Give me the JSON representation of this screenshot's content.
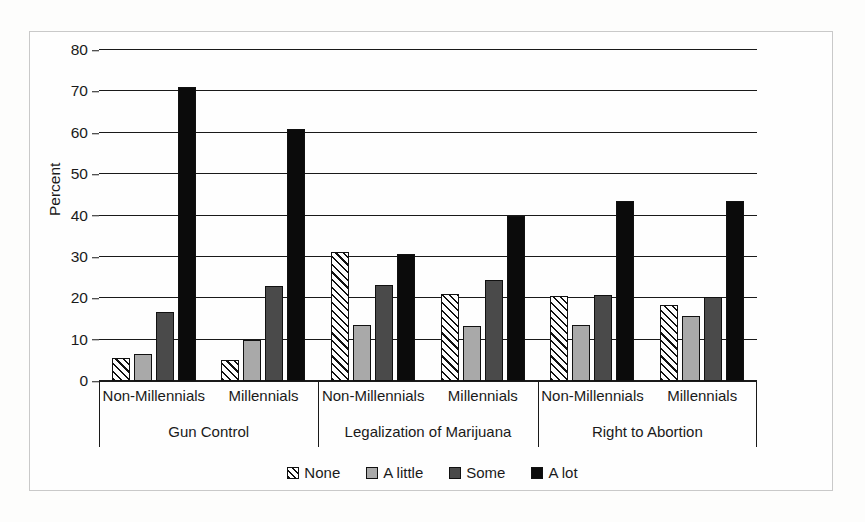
{
  "chart_data": {
    "type": "bar",
    "title": "",
    "subtitle": "",
    "xlabel": "",
    "ylabel": "Percent",
    "ylim": [
      0,
      80
    ],
    "yticks": [
      0,
      10,
      20,
      30,
      40,
      50,
      60,
      70,
      80
    ],
    "ytick_labels": [
      "0",
      "10",
      "20",
      "30",
      "40",
      "50",
      "60",
      "70",
      "80"
    ],
    "grid": true,
    "legend_position": "bottom",
    "legend_entries": [
      "None",
      "A little",
      "Some",
      "A lot"
    ],
    "group_labels": [
      "Gun Control",
      "Legalization of Marijuana",
      "Right to Abortion"
    ],
    "subgroup_labels": [
      "Non-Millennials",
      "Millennials"
    ],
    "categories": [
      "Gun Control / Non-Millennials",
      "Gun Control / Millennials",
      "Legalization of Marijuana / Non-Millennials",
      "Legalization of Marijuana / Millennials",
      "Right to Abortion / Non-Millennials",
      "Right to Abortion / Millennials"
    ],
    "series": [
      {
        "name": "None",
        "pattern": "diagonal-hatch",
        "color": "#ffffff",
        "values": [
          5.5,
          5.0,
          31.2,
          21.0,
          20.6,
          18.4
        ]
      },
      {
        "name": "A little",
        "pattern": "solid",
        "color": "#a9a9a9",
        "values": [
          6.6,
          10.0,
          13.5,
          13.2,
          13.6,
          15.8
        ]
      },
      {
        "name": "Some",
        "pattern": "solid",
        "color": "#4a4a4a",
        "values": [
          16.8,
          23.0,
          23.3,
          24.4,
          20.9,
          20.4
        ]
      },
      {
        "name": "A lot",
        "pattern": "solid",
        "color": "#0b0b0b",
        "values": [
          71.1,
          61.0,
          30.8,
          39.8,
          43.4,
          43.5
        ]
      }
    ],
    "groups": [
      {
        "label": "Gun Control",
        "subgroups": [
          {
            "label": "Non-Millennials",
            "bars": [
              {
                "series": "None",
                "value": 5.5
              },
              {
                "series": "A little",
                "value": 6.6
              },
              {
                "series": "Some",
                "value": 16.8
              },
              {
                "series": "A lot",
                "value": 71.1
              }
            ]
          },
          {
            "label": "Millennials",
            "bars": [
              {
                "series": "None",
                "value": 5.0
              },
              {
                "series": "A little",
                "value": 10.0
              },
              {
                "series": "Some",
                "value": 23.0
              },
              {
                "series": "A lot",
                "value": 61.0
              }
            ]
          }
        ]
      },
      {
        "label": "Legalization of Marijuana",
        "subgroups": [
          {
            "label": "Non-Millennials",
            "bars": [
              {
                "series": "None",
                "value": 31.2
              },
              {
                "series": "A little",
                "value": 13.5
              },
              {
                "series": "Some",
                "value": 23.3
              },
              {
                "series": "A lot",
                "value": 30.8
              }
            ]
          },
          {
            "label": "Millennials",
            "bars": [
              {
                "series": "None",
                "value": 21.0
              },
              {
                "series": "A little",
                "value": 13.2
              },
              {
                "series": "Some",
                "value": 24.4
              },
              {
                "series": "A lot",
                "value": 39.8
              }
            ]
          }
        ]
      },
      {
        "label": "Right to Abortion",
        "subgroups": [
          {
            "label": "Non-Millennials",
            "bars": [
              {
                "series": "None",
                "value": 20.6
              },
              {
                "series": "A little",
                "value": 13.6
              },
              {
                "series": "Some",
                "value": 20.9
              },
              {
                "series": "A lot",
                "value": 43.4
              }
            ]
          },
          {
            "label": "Millennials",
            "bars": [
              {
                "series": "None",
                "value": 18.4
              },
              {
                "series": "A little",
                "value": 15.8
              },
              {
                "series": "Some",
                "value": 20.4
              },
              {
                "series": "A lot",
                "value": 43.5
              }
            ]
          }
        ]
      }
    ]
  }
}
